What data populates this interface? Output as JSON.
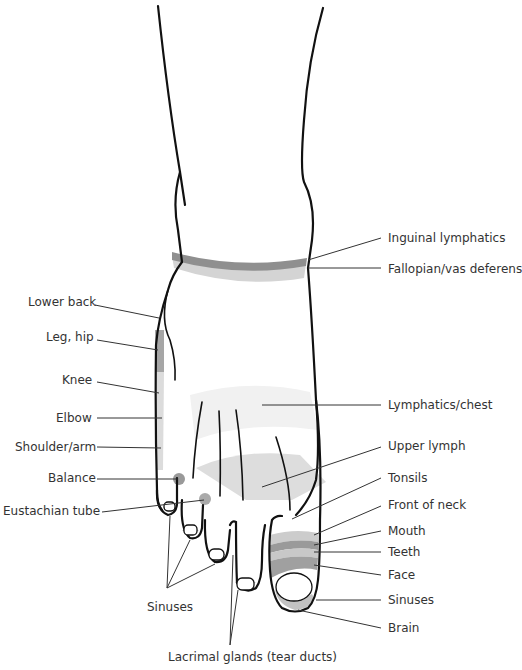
{
  "colors": {
    "outline": "#111111",
    "zone_dark": "#8f8f8f",
    "zone_mid": "#b4b4b4",
    "zone_light": "#d9d9d9",
    "zone_faint": "#ececec",
    "leader": "#333333",
    "text": "#333333"
  },
  "labels": {
    "left": {
      "lower_back": "Lower back",
      "leg_hip": "Leg, hip",
      "knee": "Knee",
      "elbow": "Elbow",
      "shoulder_arm": "Shoulder/arm",
      "balance": "Balance",
      "eustachian_tube": "Eustachian tube"
    },
    "right": {
      "inguinal_lymphatics": "Inguinal lymphatics",
      "fallopian_vas_deferens": "Fallopian/vas deferens",
      "lymphatics_chest": "Lymphatics/chest",
      "upper_lymph": "Upper lymph",
      "tonsils": "Tonsils",
      "front_of_neck": "Front of neck",
      "mouth": "Mouth",
      "teeth": "Teeth",
      "face": "Face",
      "sinuses": "Sinuses",
      "brain": "Brain"
    },
    "bottom": {
      "sinuses": "Sinuses",
      "lacrimal_glands": "Lacrimal glands (tear ducts)"
    }
  }
}
